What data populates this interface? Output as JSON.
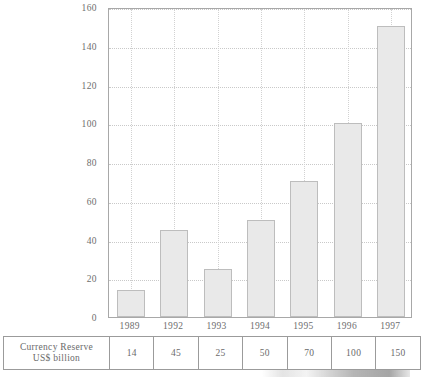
{
  "chart_data": {
    "type": "bar",
    "title": "",
    "subtitle": "",
    "xlabel": "",
    "ylabel": "",
    "categories": [
      "1989",
      "1992",
      "1993",
      "1994",
      "1995",
      "1996",
      "1997"
    ],
    "values": [
      14,
      45,
      25,
      50,
      70,
      100,
      150
    ],
    "series": [
      {
        "name": "Currency Reserve US$ billion",
        "values": [
          14,
          45,
          25,
          50,
          70,
          100,
          150
        ]
      }
    ],
    "ylim": [
      0,
      160
    ],
    "yticks": [
      0,
      20,
      40,
      60,
      80,
      100,
      120,
      140,
      160
    ],
    "ytick_labels": [
      "0",
      "20",
      "40",
      "60",
      "80",
      "100",
      "120",
      "140",
      "160"
    ],
    "grid": "dotted-both",
    "legend": "none",
    "bar_fill": "#e9e9e9",
    "bar_border": "#bdbdbd",
    "axis_color": "#a8a8a8",
    "text_color": "#6a6a6a"
  },
  "table": {
    "row_header_line1": "Currency Reserve",
    "row_header_line2": "US$ billion",
    "columns": [
      "1989",
      "1992",
      "1993",
      "1994",
      "1995",
      "1996",
      "1997"
    ],
    "values": [
      "14",
      "45",
      "25",
      "50",
      "70",
      "100",
      "150"
    ]
  }
}
